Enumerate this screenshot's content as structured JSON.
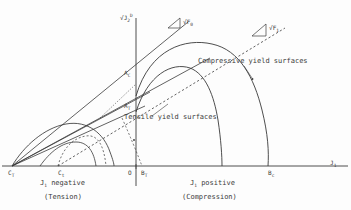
{
  "figure": {
    "background": "#fdfdfd",
    "ink": "#3a3a3a"
  },
  "axes": {
    "vertical_label": "sqrt(J2D)",
    "vertical_label_main": "J",
    "vertical_label_sub": "2",
    "vertical_label_sup": "D",
    "vertical_label_radical": "√",
    "horizontal_label_main": "J",
    "horizontal_label_sub": "1",
    "origin_label": "O",
    "x_range_note": "J1 negative to J1 positive",
    "y_axis_x_px": 136,
    "x_axis_y_px": 166
  },
  "slope_labels": [
    {
      "name": "sqrt-F0",
      "radical": "√",
      "base": "F",
      "sub": "0",
      "triangle": "slope-triangle"
    },
    {
      "name": "sqrt-F1",
      "radical": "√",
      "base": "F",
      "sub": "1",
      "triangle": "slope-triangle"
    }
  ],
  "annotations": {
    "compressive": "Compressive yield surfaces",
    "tensile": "Tensile yield surfaces",
    "left_region_line1_main": "J",
    "left_region_line1_sub": "1",
    "left_region_line1_tail": " negative",
    "left_region_line2": "(Tension)",
    "right_region_line1_main": "J",
    "right_region_line1_sub": "1",
    "right_region_line1_tail": " positive",
    "right_region_line2": "(Compression)"
  },
  "point_labels": [
    {
      "name": "C-T",
      "base": "C",
      "sub": "T",
      "x": 8,
      "y": 170
    },
    {
      "name": "C-t",
      "base": "C",
      "sub": "t",
      "x": 58,
      "y": 170
    },
    {
      "name": "O",
      "base": "O",
      "sub": "",
      "x": 128,
      "y": 170
    },
    {
      "name": "B-T",
      "base": "B",
      "sub": "T",
      "x": 141,
      "y": 170
    },
    {
      "name": "B-c",
      "base": "B",
      "sub": "c",
      "x": 268,
      "y": 170
    },
    {
      "name": "A-C",
      "base": "A",
      "sub": "C",
      "x": 124,
      "y": 70
    },
    {
      "name": "A-T",
      "base": "A",
      "sub": "T",
      "x": 124,
      "y": 103
    }
  ],
  "curves": {
    "compressive_outer": "large dome from origin region peaking high, dropping to B_c",
    "compressive_inner": "smaller dome dropping to intermediate point",
    "tensile_outer": "dome on negative J1 side from C_T",
    "tensile_inner": "smaller dome from C_t",
    "dashed_envelope": "dashed line of slope sqrt(F1) through origin region",
    "solid_envelope": "solid line of slope sqrt(F0)"
  }
}
